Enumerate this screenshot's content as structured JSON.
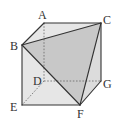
{
  "figure": {
    "type": "cube-with-shaded-triangle",
    "colors": {
      "background": "#ffffff",
      "face_light": "#e6e6e6",
      "face_shaded": "#c8c8c8",
      "edge": "#333333",
      "hidden_edge": "#666666"
    },
    "vertices": {
      "A": {
        "x": 44,
        "y": 23
      },
      "B": {
        "x": 22,
        "y": 45
      },
      "C": {
        "x": 101,
        "y": 23
      },
      "D": {
        "x": 44,
        "y": 81
      },
      "E": {
        "x": 22,
        "y": 105
      },
      "F": {
        "x": 80,
        "y": 105
      },
      "G": {
        "x": 101,
        "y": 81
      }
    },
    "labels": {
      "A": "A",
      "B": "B",
      "C": "C",
      "D": "D",
      "E": "E",
      "F": "F",
      "G": "G"
    },
    "shaded_triangle": [
      "B",
      "C",
      "F"
    ],
    "visible_edges": [
      [
        "A",
        "C"
      ],
      [
        "A",
        "B"
      ],
      [
        "B",
        "C"
      ],
      [
        "B",
        "E"
      ],
      [
        "E",
        "F"
      ],
      [
        "B",
        "F"
      ],
      [
        "C",
        "F"
      ],
      [
        "C",
        "G"
      ],
      [
        "G",
        "F"
      ]
    ],
    "hidden_edges": [
      [
        "A",
        "D"
      ],
      [
        "D",
        "G"
      ],
      [
        "D",
        "E"
      ]
    ]
  }
}
